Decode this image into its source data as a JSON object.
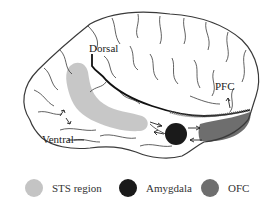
{
  "diagram": {
    "type": "brain-lateral-view",
    "labels": {
      "dorsal": "Dorsal",
      "ventral": "Ventral",
      "pfc": "PFC"
    }
  },
  "legend": {
    "items": [
      {
        "label": "STS region",
        "color": "#c4c4c4"
      },
      {
        "label": "Amygdala",
        "color": "#1a1a1a"
      },
      {
        "label": "OFC",
        "color": "#6e6e6e"
      }
    ]
  },
  "colors": {
    "outline": "#3a3a3a",
    "sts": "#c4c4c4",
    "amygdala": "#1a1a1a",
    "ofc": "#6e6e6e",
    "pathway": "#111111"
  }
}
